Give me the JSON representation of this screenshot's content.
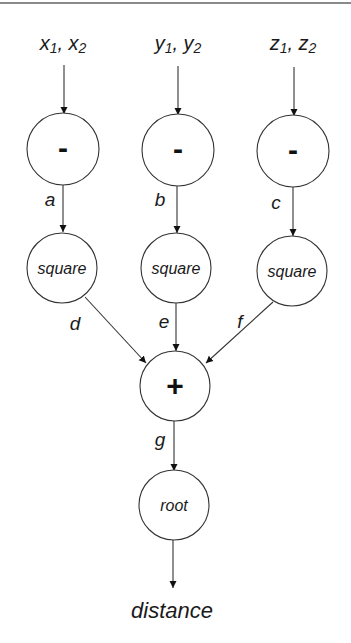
{
  "diagram": {
    "type": "computation-graph",
    "inputs": [
      {
        "id": "x",
        "var": "x",
        "sub1": "1",
        "sub2": "2"
      },
      {
        "id": "y",
        "var": "y",
        "sub1": "1",
        "sub2": "2"
      },
      {
        "id": "z",
        "var": "z",
        "sub1": "1",
        "sub2": "2"
      }
    ],
    "nodes": {
      "minus_x": {
        "label": "-"
      },
      "minus_y": {
        "label": "-"
      },
      "minus_z": {
        "label": "-"
      },
      "square_x": {
        "label": "square"
      },
      "square_y": {
        "label": "square"
      },
      "square_z": {
        "label": "square"
      },
      "plus": {
        "label": "+"
      },
      "root": {
        "label": "root"
      }
    },
    "edges": {
      "a": "a",
      "b": "b",
      "c": "c",
      "d": "d",
      "e": "e",
      "f": "f",
      "g": "g"
    },
    "output": {
      "label": "distance"
    },
    "colors": {
      "stroke": "#333333",
      "border": "#8a8a8a",
      "background": "#ffffff"
    }
  }
}
